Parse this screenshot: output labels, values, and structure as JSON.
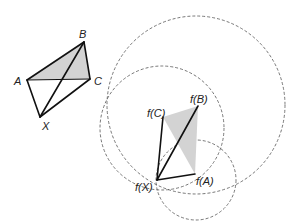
{
  "diagram": {
    "colors": {
      "edge": "#111111",
      "shade": "#d3d3d3",
      "circle": "#555555",
      "label": "#222222"
    },
    "left_figure": {
      "points": {
        "A": {
          "x": 27,
          "y": 80,
          "label": "A"
        },
        "B": {
          "x": 84,
          "y": 42,
          "label": "B"
        },
        "C": {
          "x": 90,
          "y": 79,
          "label": "C"
        },
        "X": {
          "x": 40,
          "y": 117,
          "label": "X"
        }
      },
      "shaded_triangle": [
        "A",
        "B",
        "C"
      ],
      "edges": [
        [
          "A",
          "B"
        ],
        [
          "B",
          "C"
        ],
        [
          "A",
          "C"
        ],
        [
          "A",
          "X"
        ],
        [
          "X",
          "B"
        ],
        [
          "X",
          "C"
        ]
      ]
    },
    "right_figure": {
      "points": {
        "fX": {
          "x": 157,
          "y": 180,
          "label": "f(X)"
        },
        "fA": {
          "x": 195,
          "y": 174,
          "label": "f(A)"
        },
        "fB": {
          "x": 198,
          "y": 106,
          "label": "f(B)"
        },
        "fC": {
          "x": 163,
          "y": 117,
          "label": "f(C)"
        }
      },
      "shaded_triangle": [
        "fA",
        "fB",
        "fC"
      ],
      "edges": [
        [
          "fX",
          "fA"
        ],
        [
          "fX",
          "fB"
        ],
        [
          "fX",
          "fC"
        ]
      ],
      "circles": [
        {
          "cx": 196,
          "cy": 105,
          "r": 89
        },
        {
          "cx": 162,
          "cy": 128,
          "r": 62
        },
        {
          "cx": 196,
          "cy": 180,
          "r": 40
        }
      ]
    }
  }
}
